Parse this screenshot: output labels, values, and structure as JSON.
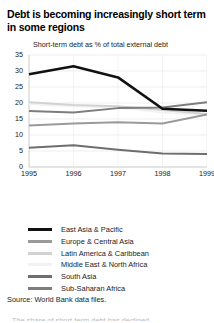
{
  "figure": {
    "title": "Debt is becoming increasingly short term in some regions",
    "source": "Source: World Bank data files.",
    "clipped_note": "The share of short-term debt has declined"
  },
  "chart_data": {
    "type": "line",
    "title": "Short-term debt as % of total external debt",
    "xlabel": "",
    "ylabel": "",
    "x": [
      "1995",
      "1996",
      "1997",
      "1998",
      "1999"
    ],
    "ylim": [
      0,
      35
    ],
    "yticks": [
      0,
      5,
      10,
      15,
      20,
      25,
      30,
      35
    ],
    "grid": true,
    "legend_position": "below",
    "series": [
      {
        "name": "East Asia & Pacific",
        "color": "#111111",
        "values": [
          29.0,
          31.5,
          28.0,
          18.2,
          17.6
        ]
      },
      {
        "name": "Europe & Central Asia",
        "color": "#9a9a9a",
        "values": [
          13.0,
          13.6,
          14.0,
          13.6,
          16.4
        ]
      },
      {
        "name": "Latin America & Caribbean",
        "color": "#d2d2d2",
        "values": [
          20.2,
          19.4,
          19.0,
          17.8,
          16.6
        ]
      },
      {
        "name": "Middle East & North Africa",
        "color": "#f2f2f2",
        "values": [
          19.6,
          19.0,
          18.6,
          17.0,
          16.2
        ]
      },
      {
        "name": "South Asia",
        "color": "#6e6e6e",
        "values": [
          6.0,
          6.8,
          5.4,
          4.2,
          4.1
        ]
      },
      {
        "name": "Sub-Saharan Africa",
        "color": "#7d7d7d",
        "values": [
          17.5,
          17.0,
          18.4,
          18.6,
          20.2
        ]
      }
    ]
  }
}
